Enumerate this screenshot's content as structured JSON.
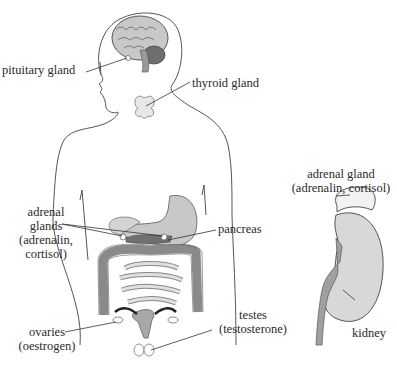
{
  "labels": {
    "pituitary": "pituitary gland",
    "thyroid": "thyroid gland",
    "adrenal_glands": [
      "adrenal",
      "glands",
      "(adrenalin,",
      "cortisol)"
    ],
    "pancreas": "pancreas",
    "ovaries": [
      "ovaries",
      "(oestrogen)"
    ],
    "testes": [
      "testes",
      "(testosterone)"
    ],
    "adrenal_gland_detail": [
      "adrenal gland",
      "(adrenalin, cortisol)"
    ],
    "kidney": "kidney"
  },
  "colors": {
    "outline": "#555555",
    "organ_light": "#d8d8d8",
    "organ_mid": "#b0b0b0",
    "organ_dark": "#707070",
    "text": "#2a2a2a"
  }
}
